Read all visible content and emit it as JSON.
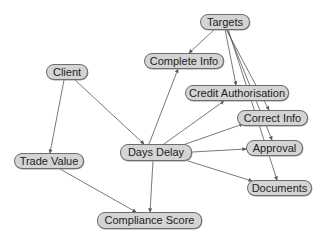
{
  "diagram": {
    "type": "directed-graph",
    "colors": {
      "node_fill": "#d4d4d4",
      "node_border": "#6e6e6e",
      "edge": "#555555",
      "text": "#222222",
      "background": "#ffffff"
    },
    "nodes": [
      {
        "id": "targets",
        "label": "Targets",
        "x": 200,
        "y": 14,
        "w": 50,
        "h": 16
      },
      {
        "id": "complete_info",
        "label": "Complete Info",
        "x": 144,
        "y": 53,
        "w": 80,
        "h": 16
      },
      {
        "id": "client",
        "label": "Client",
        "x": 46,
        "y": 64,
        "w": 42,
        "h": 16
      },
      {
        "id": "credit_authorisation",
        "label": "Credit Authorisation",
        "x": 185,
        "y": 85,
        "w": 104,
        "h": 16
      },
      {
        "id": "correct_info",
        "label": "Correct Info",
        "x": 237,
        "y": 110,
        "w": 71,
        "h": 16
      },
      {
        "id": "approval",
        "label": "Approval",
        "x": 246,
        "y": 140,
        "w": 57,
        "h": 16
      },
      {
        "id": "days_delay",
        "label": "Days Delay",
        "x": 120,
        "y": 144,
        "w": 72,
        "h": 17
      },
      {
        "id": "trade_value",
        "label": "Trade Value",
        "x": 14,
        "y": 153,
        "w": 70,
        "h": 16
      },
      {
        "id": "documents",
        "label": "Documents",
        "x": 247,
        "y": 180,
        "w": 65,
        "h": 16
      },
      {
        "id": "compliance_score",
        "label": "Compliance Score",
        "x": 97,
        "y": 212,
        "w": 105,
        "h": 17
      }
    ],
    "edges": [
      {
        "from": "targets",
        "to": "complete_info",
        "x1": 215,
        "y1": 29,
        "x2": 189,
        "y2": 53
      },
      {
        "from": "targets",
        "to": "credit_authorisation",
        "x1": 225,
        "y1": 29,
        "x2": 236,
        "y2": 85
      },
      {
        "from": "targets",
        "to": "correct_info",
        "x1": 226,
        "y1": 29,
        "x2": 269,
        "y2": 110
      },
      {
        "from": "targets",
        "to": "approval",
        "x1": 227,
        "y1": 29,
        "x2": 272,
        "y2": 140
      },
      {
        "from": "targets",
        "to": "documents",
        "x1": 228,
        "y1": 29,
        "x2": 277,
        "y2": 180
      },
      {
        "from": "client",
        "to": "trade_value",
        "x1": 64,
        "y1": 80,
        "x2": 50,
        "y2": 153
      },
      {
        "from": "client",
        "to": "days_delay",
        "x1": 75,
        "y1": 80,
        "x2": 144,
        "y2": 144
      },
      {
        "from": "trade_value",
        "to": "compliance_score",
        "x1": 60,
        "y1": 169,
        "x2": 136,
        "y2": 212
      },
      {
        "from": "days_delay",
        "to": "compliance_score",
        "x1": 153,
        "y1": 161,
        "x2": 150,
        "y2": 212
      },
      {
        "from": "days_delay",
        "to": "complete_info",
        "x1": 149,
        "y1": 144,
        "x2": 178,
        "y2": 69
      },
      {
        "from": "days_delay",
        "to": "credit_authorisation",
        "x1": 164,
        "y1": 144,
        "x2": 224,
        "y2": 101
      },
      {
        "from": "days_delay",
        "to": "correct_info",
        "x1": 180,
        "y1": 146,
        "x2": 243,
        "y2": 124
      },
      {
        "from": "days_delay",
        "to": "approval",
        "x1": 192,
        "y1": 152,
        "x2": 246,
        "y2": 149
      },
      {
        "from": "days_delay",
        "to": "documents",
        "x1": 185,
        "y1": 160,
        "x2": 252,
        "y2": 181
      }
    ]
  }
}
